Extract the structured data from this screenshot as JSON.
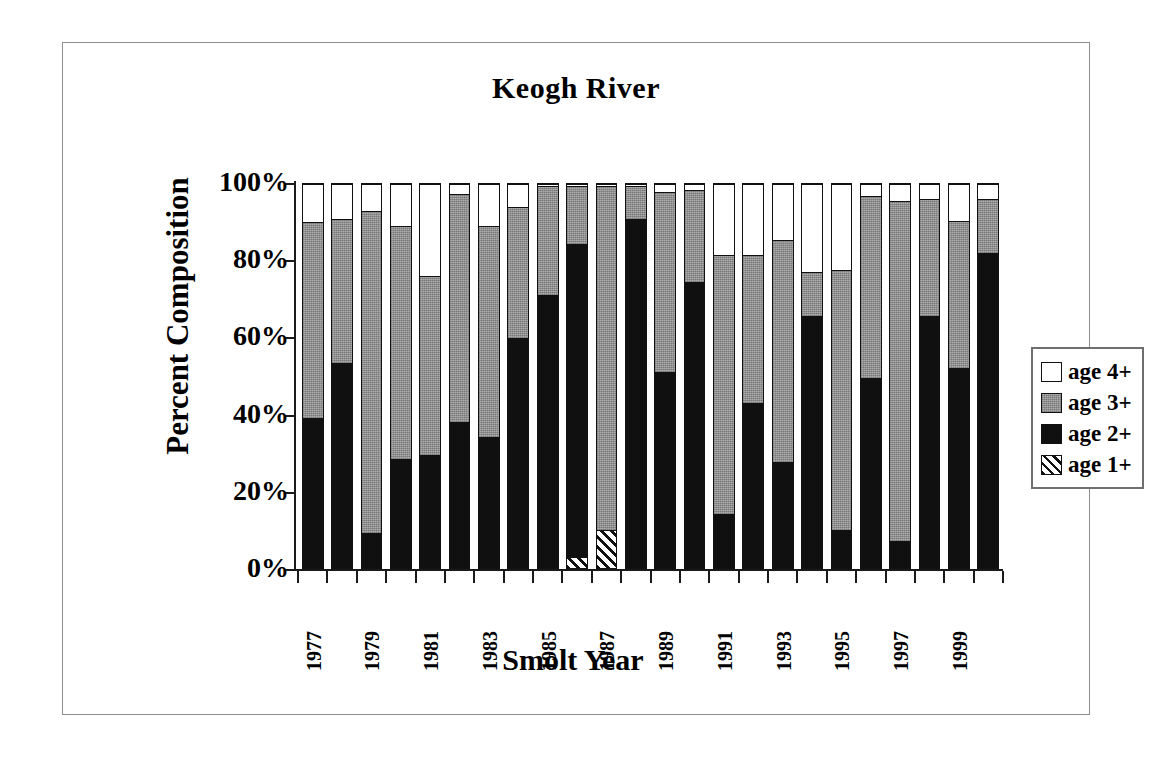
{
  "figure": {
    "title": "Keogh River"
  },
  "legend": {
    "position": "right",
    "entries": [
      {
        "label": "age 4+",
        "swatch": "white-square-icon",
        "color": "#ffffff"
      },
      {
        "label": "age 3+",
        "swatch": "gray-square-icon",
        "color": "#9b9b9b"
      },
      {
        "label": "age 2+",
        "swatch": "black-square-icon",
        "color": "#101010"
      },
      {
        "label": "age 1+",
        "swatch": "hatched-square-icon",
        "color": "#ffffff"
      }
    ]
  },
  "chart_data": {
    "type": "bar",
    "subtype": "stacked-percent",
    "title": "Keogh River",
    "xlabel": "Smolt Year",
    "ylabel": "Percent Composition",
    "ylim": [
      0,
      100
    ],
    "ytick_labels": [
      "0%",
      "20%",
      "40%",
      "60%",
      "80%",
      "100%"
    ],
    "ytick_values": [
      0,
      20,
      40,
      60,
      80,
      100
    ],
    "grid": false,
    "legend_position": "right",
    "categories": [
      "1977",
      "1978",
      "1979",
      "1980",
      "1981",
      "1982",
      "1983",
      "1984",
      "1985",
      "1986",
      "1987",
      "1988",
      "1989",
      "1990",
      "1991",
      "1992",
      "1993",
      "1994",
      "1995",
      "1996",
      "1997",
      "1998",
      "1999",
      "2000"
    ],
    "xtick_labels_shown": [
      "1977",
      "1979",
      "1981",
      "1983",
      "1985",
      "1987",
      "1989",
      "1991",
      "1993",
      "1995",
      "1997",
      "1999"
    ],
    "series": [
      {
        "name": "age 1+",
        "color": "#ffffff",
        "pattern": "diagonal-hatch",
        "values": [
          0,
          0,
          0,
          0,
          0,
          0,
          0,
          0,
          0,
          3,
          10,
          0,
          0,
          0,
          0,
          0,
          0,
          0,
          0,
          0,
          0,
          0,
          0,
          0
        ]
      },
      {
        "name": "age 2+",
        "color": "#101010",
        "pattern": "solid",
        "values": [
          39,
          53.5,
          9,
          28.5,
          29.5,
          38,
          34,
          60,
          71,
          84,
          0,
          91,
          51,
          74.5,
          14,
          43,
          27.5,
          65.5,
          10,
          49.5,
          7,
          65.5,
          52,
          82
        ]
      },
      {
        "name": "age 3+",
        "color": "#9b9b9b",
        "pattern": "solid",
        "values": [
          51,
          37.5,
          84,
          60.5,
          46.5,
          59.5,
          55,
          34,
          28.5,
          15.5,
          90.5,
          8.5,
          47,
          24,
          67.5,
          38.5,
          58,
          11.5,
          67.5,
          47.5,
          88.5,
          30.5,
          38.5,
          14
        ]
      },
      {
        "name": "age 4+",
        "color": "#ffffff",
        "pattern": "solid",
        "values": [
          10,
          9,
          7,
          11,
          24,
          2.5,
          11,
          6,
          0.5,
          0.5,
          0.5,
          0.5,
          2,
          1.5,
          18.5,
          18.5,
          14.5,
          23,
          22.5,
          3,
          4.5,
          4,
          9.5,
          4
        ]
      }
    ]
  }
}
